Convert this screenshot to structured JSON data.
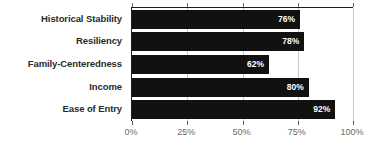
{
  "chart_data": {
    "type": "bar",
    "orientation": "horizontal",
    "title": "",
    "subtitle": "",
    "xlabel": "",
    "ylabel": "",
    "categories": [
      "Historical Stability",
      "Resiliency",
      "Family-Centeredness",
      "Income",
      "Ease of Entry"
    ],
    "values": [
      76,
      78,
      62,
      80,
      92
    ],
    "value_labels": [
      "76%",
      "78%",
      "62%",
      "80%",
      "92%"
    ],
    "xlim": [
      0,
      100
    ],
    "xticks": [
      0,
      25,
      50,
      75,
      100
    ],
    "xtick_labels": [
      "0%",
      "25%",
      "50%",
      "75%",
      "100%"
    ],
    "grid": true,
    "legend": false,
    "legend_position": "none",
    "bar_color": "#111111",
    "value_label_color": "#ffffff",
    "category_label_color": "#2b2b2b",
    "tick_label_color": "#6b6b6b",
    "gridline_color": "#c9c9c9",
    "axis_color": "#1c1c1c",
    "background_color": "#ffffff"
  }
}
